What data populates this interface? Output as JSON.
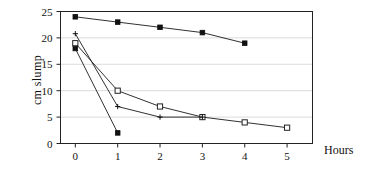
{
  "chart_data": {
    "type": "line",
    "title": "",
    "xlabel": "Hours",
    "ylabel": "cm slump",
    "xlim": [
      -0.35,
      5.6
    ],
    "ylim": [
      0,
      25
    ],
    "xticks": [
      "0",
      "1",
      "2",
      "3",
      "4",
      "5"
    ],
    "yticks": [
      "0",
      "5",
      "10",
      "15",
      "20",
      "25"
    ],
    "grid": "horizontal",
    "legend": "none",
    "series": [
      {
        "name": "series-1",
        "marker": "filled-square",
        "x": [
          0,
          1,
          2,
          3,
          4
        ],
        "values": [
          24,
          23,
          22,
          21,
          19
        ]
      },
      {
        "name": "series-2",
        "marker": "open-square",
        "x": [
          0,
          1,
          2,
          3,
          4,
          5
        ],
        "values": [
          19,
          10,
          7,
          5,
          4,
          3
        ]
      },
      {
        "name": "series-3",
        "marker": "cross",
        "x": [
          0,
          1,
          2,
          3
        ],
        "values": [
          20.8,
          7,
          5,
          5
        ]
      },
      {
        "name": "series-4",
        "marker": "filled-square",
        "x": [
          0,
          1
        ],
        "values": [
          18,
          2
        ]
      }
    ]
  }
}
